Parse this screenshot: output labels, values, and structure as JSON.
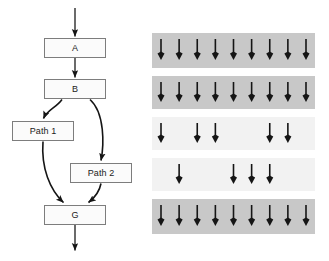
{
  "diagram": {
    "colors": {
      "node_border": "#7d7d7d",
      "node_fill": "#fbfbfb",
      "edge": "#1a1a1a",
      "band_dark": "#c8c8c8",
      "band_light": "#f2f2f2",
      "arrow": "#151515",
      "background": "#ffffff"
    }
  },
  "flowchart": {
    "nodes": [
      {
        "id": "A",
        "label": "A",
        "x": 44,
        "y": 38,
        "w": 62,
        "h": 20
      },
      {
        "id": "B",
        "label": "B",
        "x": 44,
        "y": 79,
        "w": 62,
        "h": 20
      },
      {
        "id": "P1",
        "label": "Path 1",
        "x": 12,
        "y": 121,
        "w": 62,
        "h": 20
      },
      {
        "id": "P2",
        "label": "Path 2",
        "x": 70,
        "y": 163,
        "w": 62,
        "h": 20
      },
      {
        "id": "G",
        "label": "G",
        "x": 44,
        "y": 205,
        "w": 62,
        "h": 20
      }
    ],
    "edges": [
      {
        "from": "start",
        "to": "A",
        "kind": "straight"
      },
      {
        "from": "A",
        "to": "B",
        "kind": "straight"
      },
      {
        "from": "B",
        "to": "P1",
        "kind": "curved"
      },
      {
        "from": "B",
        "to": "P2",
        "kind": "curved"
      },
      {
        "from": "P1",
        "to": "G",
        "kind": "curved"
      },
      {
        "from": "P2",
        "to": "G",
        "kind": "curved"
      },
      {
        "from": "G",
        "to": "end",
        "kind": "straight"
      }
    ]
  },
  "chart_data": {
    "type": "heatmap",
    "slots": 9,
    "legend": [
      "filled slot = arrow present",
      "empty slot = no arrow"
    ],
    "bands": [
      {
        "index": 1,
        "shade": "dark",
        "count": 9,
        "slots": [
          1,
          1,
          1,
          1,
          1,
          1,
          1,
          1,
          1
        ],
        "y": 33,
        "h": 35
      },
      {
        "index": 2,
        "shade": "dark",
        "count": 9,
        "slots": [
          1,
          1,
          1,
          1,
          1,
          1,
          1,
          1,
          1
        ],
        "y": 76,
        "h": 33
      },
      {
        "index": 3,
        "shade": "light",
        "count": 5,
        "slots": [
          1,
          0,
          1,
          1,
          0,
          0,
          1,
          1,
          0
        ],
        "y": 117,
        "h": 33
      },
      {
        "index": 4,
        "shade": "light",
        "count": 4,
        "slots": [
          0,
          1,
          0,
          0,
          1,
          1,
          1,
          0,
          0
        ],
        "y": 158,
        "h": 33
      },
      {
        "index": 5,
        "shade": "dark",
        "count": 9,
        "slots": [
          1,
          1,
          1,
          1,
          1,
          1,
          1,
          1,
          1
        ],
        "y": 199,
        "h": 35
      }
    ],
    "categories": [
      "Band 1",
      "Band 2",
      "Band 3",
      "Band 4",
      "Band 5"
    ],
    "values": [
      9,
      9,
      5,
      4,
      9
    ],
    "xlabel": "",
    "ylabel": "Arrow count",
    "ylim": [
      0,
      9
    ]
  }
}
